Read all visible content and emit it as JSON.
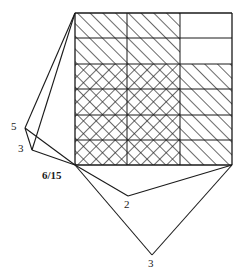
{
  "figure": {
    "background": "#ffffff",
    "stroke": "#1a1a1a",
    "hatch_color": "#2a2a2a"
  },
  "grid": {
    "x_left": 75,
    "x_right": 232,
    "y_top": 13,
    "y_bottom": 165,
    "columns": 3,
    "rows": 6,
    "column_edges": [
      75,
      127,
      180,
      232
    ],
    "row_edges": [
      13,
      38,
      64,
      89,
      115,
      140,
      165
    ],
    "cells": [
      {
        "row": 0,
        "col": 0,
        "fill": "diagonal"
      },
      {
        "row": 0,
        "col": 1,
        "fill": "diagonal"
      },
      {
        "row": 0,
        "col": 2,
        "fill": "none"
      },
      {
        "row": 1,
        "col": 0,
        "fill": "diagonal"
      },
      {
        "row": 1,
        "col": 1,
        "fill": "diagonal"
      },
      {
        "row": 1,
        "col": 2,
        "fill": "none"
      },
      {
        "row": 2,
        "col": 0,
        "fill": "cross"
      },
      {
        "row": 2,
        "col": 1,
        "fill": "cross"
      },
      {
        "row": 2,
        "col": 2,
        "fill": "diagonal"
      },
      {
        "row": 3,
        "col": 0,
        "fill": "cross"
      },
      {
        "row": 3,
        "col": 1,
        "fill": "cross"
      },
      {
        "row": 3,
        "col": 2,
        "fill": "diagonal"
      },
      {
        "row": 4,
        "col": 0,
        "fill": "cross"
      },
      {
        "row": 4,
        "col": 1,
        "fill": "cross"
      },
      {
        "row": 4,
        "col": 2,
        "fill": "diagonal"
      },
      {
        "row": 5,
        "col": 0,
        "fill": "cross"
      },
      {
        "row": 5,
        "col": 1,
        "fill": "cross"
      },
      {
        "row": 5,
        "col": 2,
        "fill": "diagonal"
      }
    ]
  },
  "vertices": [
    {
      "id": "grid-top-left",
      "x": 75,
      "y": 13
    },
    {
      "id": "grid-bottom-left",
      "x": 75,
      "y": 165
    },
    {
      "id": "grid-bottom-right",
      "x": 232,
      "y": 165
    },
    {
      "id": "v5",
      "x": 25,
      "y": 128
    },
    {
      "id": "v3a",
      "x": 32,
      "y": 150
    },
    {
      "id": "v2",
      "x": 128,
      "y": 196
    },
    {
      "id": "v3b",
      "x": 152,
      "y": 255
    }
  ],
  "edges": [
    {
      "from": "grid-top-left",
      "to": "v5"
    },
    {
      "from": "v5",
      "to": "v3a"
    },
    {
      "from": "grid-top-left",
      "to": "v3a"
    },
    {
      "from": "v3a",
      "to": "grid-bottom-left"
    },
    {
      "from": "v5",
      "to": "grid-bottom-left"
    },
    {
      "from": "grid-bottom-left",
      "to": "v2"
    },
    {
      "from": "v2",
      "to": "grid-bottom-right"
    },
    {
      "from": "grid-bottom-left",
      "to": "v3b"
    },
    {
      "from": "v3b",
      "to": "grid-bottom-right"
    }
  ],
  "labels": [
    {
      "id": "label-5",
      "text": "5",
      "x": 11,
      "y": 121,
      "bold": false
    },
    {
      "id": "label-3a",
      "text": "3",
      "x": 18,
      "y": 143,
      "bold": false
    },
    {
      "id": "label-6-15",
      "text": "6/15",
      "x": 42,
      "y": 170,
      "bold": true
    },
    {
      "id": "label-2",
      "text": "2",
      "x": 124,
      "y": 199,
      "bold": false
    },
    {
      "id": "label-3b",
      "text": "3",
      "x": 148,
      "y": 258,
      "bold": false
    }
  ]
}
